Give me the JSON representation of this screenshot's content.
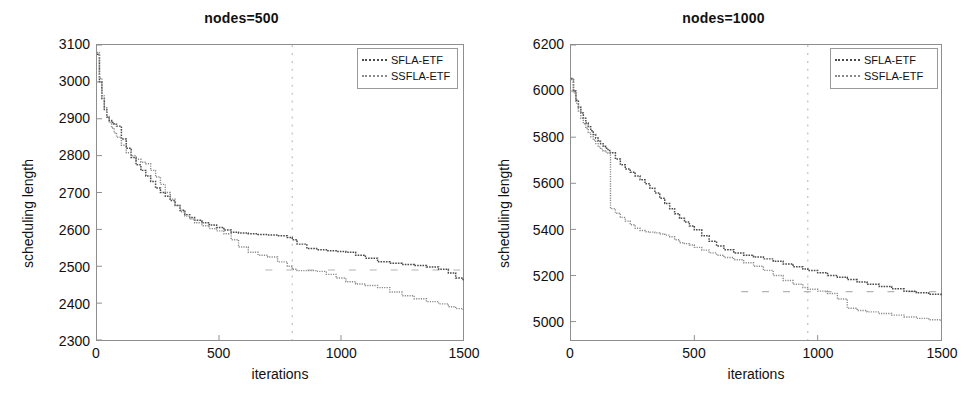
{
  "figure": {
    "background": "#ffffff",
    "series_colors": {
      "sfla": "#4a4a4a",
      "ssfla": "#8a8a8a"
    }
  },
  "chart_data": [
    {
      "type": "line",
      "title": "nodes=500",
      "xlabel": "iterations",
      "ylabel": "scheduling length",
      "xlim": [
        0,
        1500
      ],
      "ylim": [
        2300,
        3100
      ],
      "xticks": [
        0,
        500,
        1000,
        1500
      ],
      "xtick_labels": [
        "0",
        "500",
        "1000",
        "1500"
      ],
      "yticks": [
        2300,
        2400,
        2500,
        2600,
        2700,
        2800,
        2900,
        3000,
        3100
      ],
      "ytick_labels": [
        "2300",
        "2400",
        "2500",
        "2600",
        "2700",
        "2800",
        "2900",
        "3000",
        "3100"
      ],
      "grid": false,
      "legend_position": "upper right",
      "x": [
        0,
        10,
        20,
        30,
        40,
        50,
        60,
        70,
        80,
        100,
        120,
        140,
        160,
        180,
        200,
        220,
        240,
        260,
        280,
        300,
        320,
        340,
        360,
        380,
        400,
        430,
        460,
        490,
        520,
        550,
        580,
        620,
        660,
        700,
        740,
        780,
        800,
        820,
        860,
        900,
        940,
        980,
        1020,
        1060,
        1100,
        1150,
        1200,
        1250,
        1300,
        1350,
        1400,
        1440,
        1470,
        1500
      ],
      "series": [
        {
          "name": "SFLA-ETF",
          "values": [
            3075,
            3000,
            2955,
            2925,
            2905,
            2895,
            2890,
            2885,
            2880,
            2845,
            2820,
            2795,
            2775,
            2760,
            2745,
            2730,
            2712,
            2700,
            2690,
            2678,
            2665,
            2652,
            2640,
            2632,
            2625,
            2618,
            2612,
            2605,
            2598,
            2592,
            2590,
            2588,
            2586,
            2585,
            2583,
            2578,
            2572,
            2560,
            2548,
            2545,
            2542,
            2540,
            2538,
            2530,
            2522,
            2512,
            2508,
            2505,
            2502,
            2498,
            2492,
            2482,
            2468,
            2462
          ]
        },
        {
          "name": "SSFLA-ETF",
          "values": [
            3080,
            3010,
            2962,
            2930,
            2906,
            2890,
            2875,
            2862,
            2850,
            2828,
            2808,
            2800,
            2790,
            2782,
            2778,
            2760,
            2742,
            2722,
            2700,
            2682,
            2665,
            2648,
            2636,
            2628,
            2618,
            2610,
            2602,
            2596,
            2588,
            2572,
            2552,
            2538,
            2530,
            2525,
            2512,
            2500,
            2492,
            2488,
            2488,
            2486,
            2478,
            2468,
            2458,
            2452,
            2448,
            2442,
            2430,
            2420,
            2412,
            2404,
            2398,
            2390,
            2385,
            2382
          ]
        }
      ],
      "artifacts": {
        "vertical_dashed_x": 800,
        "horizontal_dashed_y": 2490
      }
    },
    {
      "type": "line",
      "title": "nodes=1000",
      "xlabel": "iterations",
      "ylabel": "scheduling length",
      "xlim": [
        0,
        1500
      ],
      "ylim": [
        4920,
        6200
      ],
      "xticks": [
        0,
        500,
        1000,
        1500
      ],
      "xtick_labels": [
        "0",
        "500",
        "1000",
        "1500"
      ],
      "yticks": [
        5000,
        5200,
        5400,
        5600,
        5800,
        6000,
        6200
      ],
      "ytick_labels": [
        "5000",
        "5200",
        "5400",
        "5600",
        "5800",
        "6000",
        "6200"
      ],
      "grid": false,
      "legend_position": "upper right",
      "x": [
        0,
        10,
        20,
        30,
        40,
        50,
        60,
        70,
        80,
        90,
        100,
        110,
        120,
        130,
        140,
        150,
        160,
        180,
        200,
        220,
        240,
        260,
        280,
        300,
        320,
        340,
        360,
        380,
        400,
        420,
        440,
        460,
        480,
        500,
        530,
        560,
        590,
        620,
        660,
        700,
        740,
        780,
        820,
        860,
        900,
        940,
        960,
        1000,
        1040,
        1080,
        1120,
        1160,
        1200,
        1250,
        1300,
        1350,
        1400,
        1450,
        1500
      ],
      "series": [
        {
          "name": "SFLA-ETF",
          "values": [
            6055,
            6000,
            5960,
            5930,
            5905,
            5882,
            5862,
            5845,
            5828,
            5812,
            5796,
            5782,
            5772,
            5762,
            5752,
            5742,
            5732,
            5705,
            5680,
            5662,
            5648,
            5632,
            5615,
            5598,
            5578,
            5558,
            5535,
            5512,
            5490,
            5468,
            5448,
            5432,
            5415,
            5398,
            5372,
            5348,
            5328,
            5312,
            5298,
            5288,
            5280,
            5272,
            5262,
            5250,
            5238,
            5228,
            5222,
            5212,
            5200,
            5192,
            5182,
            5172,
            5162,
            5152,
            5142,
            5132,
            5125,
            5118,
            5110
          ]
        },
        {
          "name": "SSFLA-ETF",
          "values": [
            6050,
            5992,
            5948,
            5912,
            5882,
            5858,
            5838,
            5820,
            5802,
            5788,
            5772,
            5758,
            5748,
            5740,
            5735,
            5730,
            5490,
            5470,
            5452,
            5436,
            5420,
            5405,
            5395,
            5390,
            5388,
            5385,
            5380,
            5375,
            5368,
            5355,
            5342,
            5338,
            5332,
            5322,
            5310,
            5298,
            5288,
            5278,
            5268,
            5255,
            5240,
            5222,
            5200,
            5178,
            5162,
            5148,
            5140,
            5132,
            5122,
            5098,
            5058,
            5048,
            5042,
            5035,
            5028,
            5020,
            5014,
            5008,
            5002
          ]
        }
      ],
      "artifacts": {
        "vertical_dashed_x": 960,
        "horizontal_dashed_y": 5130
      }
    }
  ]
}
